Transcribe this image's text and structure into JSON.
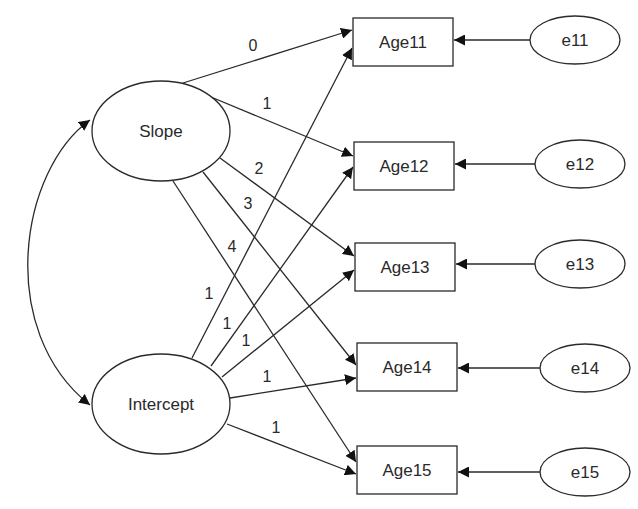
{
  "diagram": {
    "type": "latent growth curve path diagram",
    "latent_factors": [
      {
        "id": "slope",
        "label": "Slope",
        "cx": 161,
        "cy": 131,
        "rx": 69,
        "ry": 50
      },
      {
        "id": "intercept",
        "label": "Intercept",
        "cx": 161,
        "cy": 404,
        "rx": 69,
        "ry": 50
      }
    ],
    "observed": [
      {
        "id": "age11",
        "label": "Age11",
        "x": 353,
        "y": 18,
        "w": 100,
        "h": 48
      },
      {
        "id": "age12",
        "label": "Age12",
        "x": 354,
        "y": 142,
        "w": 100,
        "h": 48
      },
      {
        "id": "age13",
        "label": "Age13",
        "x": 355,
        "y": 243,
        "w": 100,
        "h": 48
      },
      {
        "id": "age14",
        "label": "Age14",
        "x": 357,
        "y": 343,
        "w": 100,
        "h": 48
      },
      {
        "id": "age15",
        "label": "Age15",
        "x": 357,
        "y": 446,
        "w": 100,
        "h": 48
      }
    ],
    "errors": [
      {
        "id": "e11",
        "label": "e11",
        "cx": 575,
        "cy": 40,
        "rx": 45,
        "ry": 24
      },
      {
        "id": "e12",
        "label": "e12",
        "cx": 580,
        "cy": 164,
        "rx": 45,
        "ry": 24
      },
      {
        "id": "e13",
        "label": "e13",
        "cx": 580,
        "cy": 264,
        "rx": 45,
        "ry": 24
      },
      {
        "id": "e14",
        "label": "e14",
        "cx": 585,
        "cy": 368,
        "rx": 45,
        "ry": 24
      },
      {
        "id": "e15",
        "label": "e15",
        "cx": 585,
        "cy": 472,
        "rx": 45,
        "ry": 24
      }
    ],
    "slope_loadings": [
      {
        "to": "Age11",
        "label": "0",
        "x1": 183,
        "y1": 83,
        "x2": 352,
        "y2": 30,
        "lx": 253,
        "ly": 51
      },
      {
        "to": "Age12",
        "label": "1",
        "x1": 211,
        "y1": 97,
        "x2": 353,
        "y2": 156,
        "lx": 267,
        "ly": 109
      },
      {
        "to": "Age13",
        "label": "2",
        "x1": 220,
        "y1": 158,
        "x2": 354,
        "y2": 256,
        "lx": 259,
        "ly": 174
      },
      {
        "to": "Age14",
        "label": "3",
        "x1": 203,
        "y1": 172,
        "x2": 356,
        "y2": 365,
        "lx": 248,
        "ly": 209
      },
      {
        "to": "Age15",
        "label": "4",
        "x1": 173,
        "y1": 181,
        "x2": 356,
        "y2": 462,
        "lx": 232,
        "ly": 252
      }
    ],
    "intercept_loadings": [
      {
        "to": "Age11",
        "label": "1",
        "x1": 192,
        "y1": 358,
        "x2": 352,
        "y2": 48,
        "lx": 209,
        "ly": 299
      },
      {
        "to": "Age12",
        "label": "1",
        "x1": 211,
        "y1": 366,
        "x2": 353,
        "y2": 167,
        "lx": 227,
        "ly": 329
      },
      {
        "to": "Age13",
        "label": "1",
        "x1": 222,
        "y1": 377,
        "x2": 354,
        "y2": 270,
        "lx": 246,
        "ly": 346
      },
      {
        "to": "Age14",
        "label": "1",
        "x1": 230,
        "y1": 398,
        "x2": 356,
        "y2": 378,
        "lx": 267,
        "ly": 382
      },
      {
        "to": "Age15",
        "label": "1",
        "x1": 227,
        "y1": 424,
        "x2": 356,
        "y2": 474,
        "lx": 276,
        "ly": 433
      }
    ],
    "covariance": {
      "from": "Slope",
      "to": "Intercept",
      "label": ""
    },
    "colors": {
      "stroke": "#2a2a2a",
      "fill": "#ffffff",
      "text": "#2a2a2a"
    }
  }
}
